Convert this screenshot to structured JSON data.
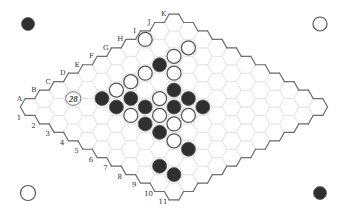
{
  "board": {
    "size": 11,
    "columns": [
      "A",
      "B",
      "C",
      "D",
      "E",
      "F",
      "G",
      "H",
      "I",
      "J",
      "K"
    ],
    "rows": [
      "1",
      "2",
      "3",
      "4",
      "5",
      "6",
      "7",
      "8",
      "9",
      "10",
      "11"
    ]
  },
  "stones": [
    {
      "cell": "I1",
      "color": "white"
    },
    {
      "cell": "J3",
      "color": "white"
    },
    {
      "cell": "I3",
      "color": "white"
    },
    {
      "cell": "H3",
      "color": "black"
    },
    {
      "cell": "G3",
      "color": "white"
    },
    {
      "cell": "H4",
      "color": "white"
    },
    {
      "cell": "F3",
      "color": "white"
    },
    {
      "cell": "E3",
      "color": "white"
    },
    {
      "cell": "D3",
      "color": "black"
    },
    {
      "cell": "E4",
      "color": "black"
    },
    {
      "cell": "G5",
      "color": "black"
    },
    {
      "cell": "D4",
      "color": "black"
    },
    {
      "cell": "E5",
      "color": "black"
    },
    {
      "cell": "F5",
      "color": "white"
    },
    {
      "cell": "G6",
      "color": "black"
    },
    {
      "cell": "F6",
      "color": "black"
    },
    {
      "cell": "G7",
      "color": "black"
    },
    {
      "cell": "D5",
      "color": "white"
    },
    {
      "cell": "E6",
      "color": "white"
    },
    {
      "cell": "F7",
      "color": "white"
    },
    {
      "cell": "D6",
      "color": "black"
    },
    {
      "cell": "E7",
      "color": "white"
    },
    {
      "cell": "D7",
      "color": "black"
    },
    {
      "cell": "D8",
      "color": "white"
    },
    {
      "cell": "D9",
      "color": "black"
    },
    {
      "cell": "B9",
      "color": "black"
    },
    {
      "cell": "B10",
      "color": "black"
    }
  ],
  "move_marker": {
    "cell": "C2",
    "label": "28"
  },
  "corner_markers": [
    {
      "position": "top-left",
      "color": "black"
    },
    {
      "position": "top-right",
      "color": "white"
    },
    {
      "position": "bottom-left",
      "color": "white"
    },
    {
      "position": "bottom-right",
      "color": "black"
    }
  ],
  "colors": {
    "black_stone": "#2f2f2f",
    "white_stone": "#ffffff",
    "stone_outline": "#555555",
    "grid_line": "#e2e2e2",
    "board_border": "#707070"
  }
}
